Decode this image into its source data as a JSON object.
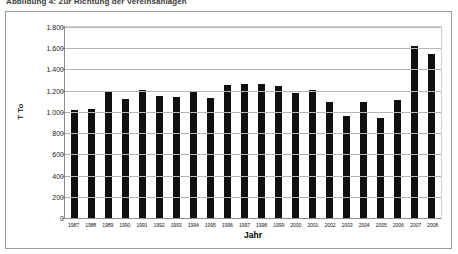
{
  "caption": {
    "text": "Abbildung 4: Zur Richtung der Vereinsanlagen"
  },
  "chart_data": {
    "type": "bar",
    "title": "",
    "xlabel": "Jahr",
    "ylabel": "T To",
    "ylim": [
      0,
      1800
    ],
    "ytick_step": 200,
    "grid": true,
    "legend": false,
    "bar_color": "#101010",
    "categories": [
      "1987",
      "1988",
      "1989",
      "1990",
      "1991",
      "1992",
      "1993",
      "1994",
      "1995",
      "1996",
      "1997",
      "1998",
      "1999",
      "2000",
      "2001",
      "2002",
      "2003",
      "2004",
      "2005",
      "2006",
      "2007",
      "2008"
    ],
    "values": [
      1020,
      1030,
      1185,
      1125,
      1210,
      1150,
      1140,
      1185,
      1135,
      1250,
      1260,
      1265,
      1240,
      1180,
      1210,
      1095,
      960,
      1095,
      940,
      1115,
      1625,
      1550
    ],
    "ytick_labels": [
      "1.800",
      "1.600",
      "1.400",
      "1.200",
      "1.000",
      "800",
      "600",
      "400",
      "200",
      "0"
    ],
    "ytick_values": [
      1800,
      1600,
      1400,
      1200,
      1000,
      800,
      600,
      400,
      200,
      0
    ]
  }
}
